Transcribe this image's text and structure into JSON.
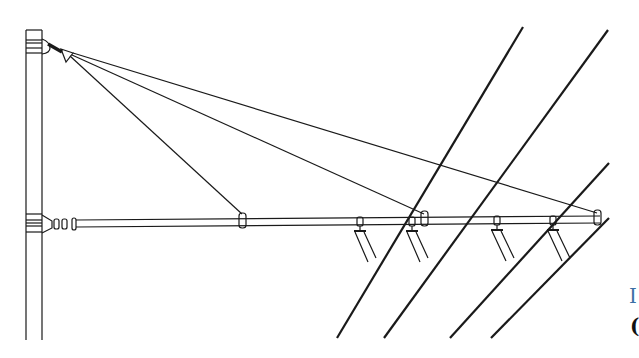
{
  "diagram": {
    "components": {
      "mast": "mast",
      "stay_tube": "cantilever-tube",
      "diagonal_ties": 3,
      "registration_arms": 4,
      "contact_wires": 4
    }
  },
  "edge_text": {
    "line1": "I",
    "line2": "("
  },
  "colors": {
    "ink": "#1a1a1a",
    "edge_blue": "#3b6fa5"
  }
}
